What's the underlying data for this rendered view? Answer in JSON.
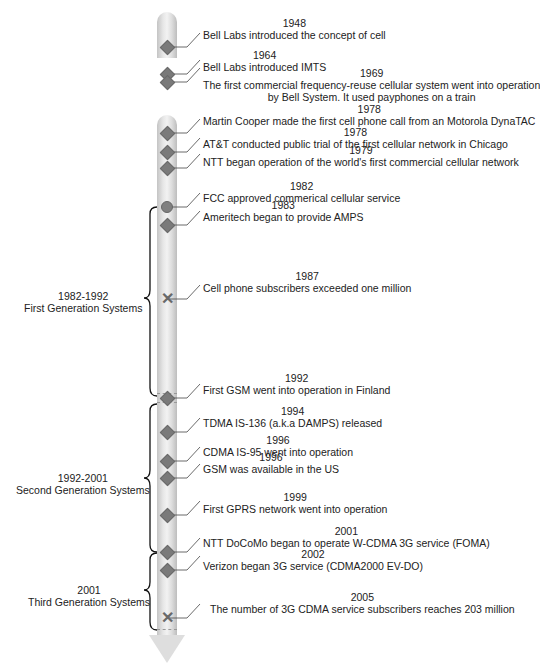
{
  "diagram": {
    "events": [
      {
        "year": "1948",
        "text": "Bell Labs introduced the concept of cell",
        "marker": "diamond"
      },
      {
        "year": "1964",
        "text": "Bell Labs introduced IMTS",
        "marker": "diamond"
      },
      {
        "year": "1969",
        "text": "The first commercial frequency-reuse cellular system went into operation",
        "text2": "by Bell System.  It used payphones on a train",
        "marker": "diamond"
      },
      {
        "year": "1978",
        "text": "Martin Cooper made the first cell phone call from an Motorola DynaTAC",
        "marker": "diamond"
      },
      {
        "year": "1978",
        "text": "AT&T conducted public trial of the first cellular network in Chicago",
        "marker": "diamond"
      },
      {
        "year": "1979",
        "text": "NTT began operation of the world's first commercial cellular network",
        "marker": "diamond"
      },
      {
        "year": "1982",
        "text": "FCC approved commerical cellular service",
        "marker": "circle"
      },
      {
        "year": "1983",
        "text": "Ameritech began to provide AMPS",
        "marker": "diamond"
      },
      {
        "year": "1987",
        "text": "Cell phone subscribers exceeded one million",
        "marker": "x"
      },
      {
        "year": "1992",
        "text": "First GSM went into operation in Finland",
        "marker": "diamond"
      },
      {
        "year": "1994",
        "text": "TDMA IS-136 (a.k.a DAMPS) released",
        "marker": "diamond"
      },
      {
        "year": "1996",
        "text": "CDMA IS-95 went into operation",
        "marker": "diamond"
      },
      {
        "year": "1996",
        "text": "GSM was available in the US",
        "marker": "diamond"
      },
      {
        "year": "1999",
        "text": "First GPRS network went into operation",
        "marker": "diamond"
      },
      {
        "year": "2001",
        "text": "NTT DoCoMo began to operate W-CDMA 3G service (FOMA)",
        "marker": "diamond"
      },
      {
        "year": "2002",
        "text": "Verizon began 3G service (CDMA2000 EV-DO)",
        "marker": "diamond"
      },
      {
        "year": "2005",
        "text": "The number of 3G CDMA service subscribers reaches 203 million",
        "marker": "x"
      }
    ],
    "eras": [
      {
        "years": "1982-1992",
        "label": "First Generation Systems"
      },
      {
        "years": "1992-2001",
        "label": "Second Generation Systems"
      },
      {
        "years": "2001",
        "label": "Third Generation Systems"
      }
    ],
    "colors": {
      "marker": "#7a7a7a",
      "rod": "#e0e0e0",
      "text": "#222222"
    }
  }
}
